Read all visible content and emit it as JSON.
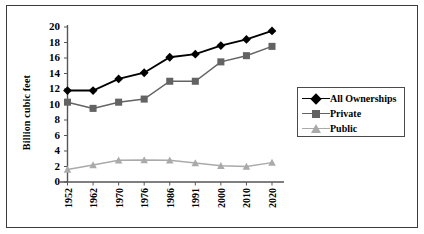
{
  "chart_data": {
    "type": "line",
    "title": "",
    "xlabel": "",
    "ylabel": "Billion cubic feet",
    "categories": [
      "1952",
      "1962",
      "1970",
      "1976",
      "1986",
      "1991",
      "2000",
      "2010",
      "2020"
    ],
    "series": [
      {
        "name": "All Ownerships",
        "marker": "diamond",
        "color": "#000000",
        "values": [
          11.8,
          11.8,
          13.3,
          14.1,
          16.1,
          16.5,
          17.6,
          18.4,
          19.5
        ]
      },
      {
        "name": "Private",
        "marker": "square",
        "color": "#636363",
        "values": [
          10.3,
          9.5,
          10.3,
          10.7,
          13.0,
          13.0,
          15.5,
          16.3,
          17.5
        ]
      },
      {
        "name": "Public",
        "marker": "triangle",
        "color": "#aaaaaa",
        "values": [
          1.6,
          2.2,
          2.8,
          2.85,
          2.8,
          2.45,
          2.1,
          2.0,
          2.5
        ]
      }
    ],
    "ylim": [
      0,
      20
    ],
    "ytick_values": [
      "0",
      "2",
      "4",
      "6",
      "8",
      "10",
      "12",
      "14",
      "16",
      "18",
      "20"
    ],
    "ytick_step": 2,
    "grid": false,
    "legend_position": "right"
  },
  "legend": {
    "entries": [
      {
        "label": "All Ownerships"
      },
      {
        "label": "Private"
      },
      {
        "label": "Public"
      }
    ]
  }
}
